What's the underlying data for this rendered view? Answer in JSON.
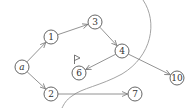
{
  "diagram": {
    "type": "directed-graph",
    "nodes": [
      {
        "id": "a",
        "label": "a",
        "italic": true,
        "x": 22,
        "y": 67
      },
      {
        "id": "1",
        "label": "1",
        "x": 51,
        "y": 37
      },
      {
        "id": "3",
        "label": "3",
        "x": 95,
        "y": 22
      },
      {
        "id": "4",
        "label": "4",
        "x": 122,
        "y": 51
      },
      {
        "id": "6",
        "label": "6",
        "x": 79,
        "y": 73
      },
      {
        "id": "10",
        "label": "10",
        "x": 177,
        "y": 78
      },
      {
        "id": "2",
        "label": "2",
        "x": 51,
        "y": 94
      },
      {
        "id": "7",
        "label": "7",
        "x": 135,
        "y": 94
      }
    ],
    "edges": [
      {
        "from": "a",
        "to": "1"
      },
      {
        "from": "a",
        "to": "2"
      },
      {
        "from": "1",
        "to": "3"
      },
      {
        "from": "3",
        "to": "4"
      },
      {
        "from": "4",
        "to": "6"
      },
      {
        "from": "4",
        "to": "10"
      },
      {
        "from": "2",
        "to": "7"
      }
    ],
    "annotations": [
      {
        "type": "flag-icon",
        "near": "6"
      },
      {
        "type": "boundary-curve",
        "description": "curved line separating region"
      }
    ],
    "colors": {
      "node_stroke": "#555555",
      "edge": "#777777",
      "boundary": "#999999",
      "text": "#333333"
    }
  }
}
